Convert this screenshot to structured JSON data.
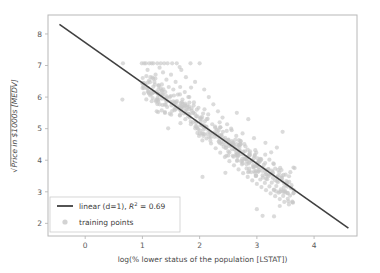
{
  "figure": {
    "background_color": "#ffffff",
    "axes_frame_color": "#b8b8b8",
    "plot_background": "#ffffff"
  },
  "chart_data": {
    "type": "scatter",
    "title": "",
    "xlabel": "log(% lower status of the population [LSTAT])",
    "ylabel": "Price in $1000s [MEDV]",
    "ylabel_prefix": "√",
    "xlim": [
      -0.65,
      4.75
    ],
    "ylim": [
      1.6,
      8.6
    ],
    "xticks": [
      0,
      1,
      2,
      3,
      4
    ],
    "xtick_labels": [
      "0",
      "1",
      "2",
      "3",
      "4"
    ],
    "yticks": [
      2,
      3,
      4,
      5,
      6,
      7,
      8
    ],
    "ytick_labels": [
      "2",
      "3",
      "4",
      "5",
      "6",
      "7",
      "8"
    ],
    "grid": false,
    "legend_position": "lower left",
    "series": [
      {
        "name": "training points",
        "type": "scatter",
        "marker_color": "#c8c8c8",
        "marker_size": 4.2,
        "marker_alpha": 0.65,
        "n_points": 506,
        "points": [
          [
            0.66,
            7.07
          ],
          [
            0.65,
            5.92
          ],
          [
            0.99,
            7.07
          ],
          [
            1.03,
            7.07
          ],
          [
            1.06,
            7.07
          ],
          [
            1.09,
            6.86
          ],
          [
            1.12,
            7.07
          ],
          [
            1.14,
            6.63
          ],
          [
            1.16,
            7.07
          ],
          [
            1.19,
            7.07
          ],
          [
            1.21,
            6.48
          ],
          [
            1.23,
            6.71
          ],
          [
            1.26,
            7.07
          ],
          [
            1.28,
            6.24
          ],
          [
            1.3,
            6.93
          ],
          [
            1.32,
            7.07
          ],
          [
            1.34,
            6.4
          ],
          [
            1.36,
            6.78
          ],
          [
            1.38,
            7.07
          ],
          [
            1.4,
            6.16
          ],
          [
            1.42,
            6.55
          ],
          [
            1.44,
            7.07
          ],
          [
            1.46,
            6.32
          ],
          [
            1.48,
            6.0
          ],
          [
            1.5,
            6.71
          ],
          [
            1.52,
            7.07
          ],
          [
            1.54,
            6.24
          ],
          [
            1.56,
            5.83
          ],
          [
            1.58,
            6.48
          ],
          [
            1.6,
            7.07
          ],
          [
            1.62,
            6.08
          ],
          [
            1.64,
            5.66
          ],
          [
            1.66,
            6.32
          ],
          [
            1.68,
            6.86
          ],
          [
            1.7,
            5.92
          ],
          [
            1.72,
            5.48
          ],
          [
            1.74,
            6.16
          ],
          [
            1.76,
            6.63
          ],
          [
            1.78,
            5.74
          ],
          [
            1.8,
            5.39
          ],
          [
            1.82,
            6.0
          ],
          [
            1.84,
            7.07
          ],
          [
            1.86,
            5.57
          ],
          [
            1.88,
            5.2
          ],
          [
            1.9,
            5.83
          ],
          [
            1.92,
            6.48
          ],
          [
            1.94,
            5.39
          ],
          [
            1.96,
            5.02
          ],
          [
            1.98,
            5.66
          ],
          [
            2.0,
            7.07
          ],
          [
            2.02,
            5.22
          ],
          [
            2.04,
            4.85
          ],
          [
            2.06,
            5.48
          ],
          [
            2.08,
            6.24
          ],
          [
            2.1,
            5.05
          ],
          [
            2.12,
            4.69
          ],
          [
            2.14,
            5.31
          ],
          [
            2.16,
            6.0
          ],
          [
            2.18,
            4.9
          ],
          [
            2.2,
            4.53
          ],
          [
            2.22,
            5.14
          ],
          [
            2.24,
            5.77
          ],
          [
            2.26,
            4.74
          ],
          [
            2.28,
            4.38
          ],
          [
            2.3,
            4.97
          ],
          [
            2.32,
            5.55
          ],
          [
            2.34,
            4.58
          ],
          [
            2.36,
            4.24
          ],
          [
            2.38,
            4.8
          ],
          [
            2.4,
            5.35
          ],
          [
            2.42,
            4.43
          ],
          [
            2.44,
            4.1
          ],
          [
            2.46,
            4.64
          ],
          [
            2.48,
            5.14
          ],
          [
            2.5,
            4.28
          ],
          [
            2.52,
            3.97
          ],
          [
            2.54,
            4.48
          ],
          [
            2.56,
            4.95
          ],
          [
            2.58,
            4.14
          ],
          [
            2.6,
            3.84
          ],
          [
            2.62,
            4.33
          ],
          [
            2.64,
            4.77
          ],
          [
            2.66,
            4.0
          ],
          [
            2.68,
            3.71
          ],
          [
            2.7,
            4.18
          ],
          [
            2.72,
            4.6
          ],
          [
            2.74,
            3.87
          ],
          [
            2.76,
            3.59
          ],
          [
            2.78,
            4.04
          ],
          [
            2.8,
            4.44
          ],
          [
            2.82,
            3.74
          ],
          [
            2.84,
            3.47
          ],
          [
            2.86,
            3.9
          ],
          [
            2.88,
            4.28
          ],
          [
            2.9,
            3.62
          ],
          [
            2.92,
            3.36
          ],
          [
            2.94,
            3.77
          ],
          [
            2.96,
            4.13
          ],
          [
            2.98,
            3.5
          ],
          [
            3.0,
            3.25
          ],
          [
            3.02,
            3.64
          ],
          [
            3.04,
            3.99
          ],
          [
            3.06,
            3.39
          ],
          [
            3.08,
            3.15
          ],
          [
            3.1,
            3.52
          ],
          [
            3.12,
            3.85
          ],
          [
            3.14,
            3.28
          ],
          [
            3.16,
            3.05
          ],
          [
            3.18,
            3.4
          ],
          [
            3.2,
            3.72
          ],
          [
            3.22,
            3.17
          ],
          [
            3.24,
            2.95
          ],
          [
            3.26,
            3.29
          ],
          [
            3.28,
            3.59
          ],
          [
            3.3,
            3.07
          ],
          [
            3.32,
            2.86
          ],
          [
            3.34,
            3.18
          ],
          [
            3.36,
            3.47
          ],
          [
            3.38,
            2.97
          ],
          [
            3.4,
            2.77
          ],
          [
            3.42,
            3.08
          ],
          [
            3.44,
            3.35
          ],
          [
            3.46,
            2.87
          ],
          [
            3.48,
            2.68
          ],
          [
            3.5,
            2.98
          ],
          [
            3.52,
            3.24
          ],
          [
            3.54,
            2.78
          ],
          [
            3.56,
            2.6
          ],
          [
            3.58,
            2.88
          ],
          [
            3.6,
            3.13
          ],
          [
            3.62,
            2.69
          ],
          [
            3.64,
            3.77
          ],
          [
            3.66,
            3.75
          ],
          [
            3.1,
            2.24
          ],
          [
            3.3,
            2.22
          ],
          [
            3.0,
            2.45
          ],
          [
            3.4,
            2.55
          ],
          [
            3.55,
            2.7
          ],
          [
            2.05,
            3.47
          ],
          [
            2.45,
            3.6
          ],
          [
            1.45,
            5.01
          ],
          [
            1.35,
            5.75
          ],
          [
            1.55,
            6.05
          ],
          [
            1.75,
            5.3
          ],
          [
            1.95,
            5.6
          ],
          [
            2.15,
            5.45
          ],
          [
            2.35,
            5.2
          ],
          [
            2.55,
            5.0
          ],
          [
            2.75,
            4.85
          ],
          [
            2.95,
            4.7
          ],
          [
            3.15,
            4.55
          ],
          [
            3.35,
            4.4
          ],
          [
            3.45,
            4.9
          ],
          [
            3.25,
            4.25
          ],
          [
            2.85,
            5.3
          ],
          [
            2.65,
            5.5
          ],
          [
            1.85,
            6.3
          ],
          [
            1.65,
            6.95
          ],
          [
            1.15,
            6.1
          ],
          [
            1.25,
            5.55
          ],
          [
            1.05,
            6.4
          ],
          [
            3.05,
            3.95
          ]
        ]
      },
      {
        "name": "linear (d=1)",
        "type": "line",
        "line_color": "#404040",
        "line_width": 1.6,
        "slope": -1.278,
        "intercept": 7.725,
        "x_start": -0.45,
        "x_end": 4.6,
        "y_start": 8.3,
        "y_end": 1.85,
        "r_squared": 0.69
      }
    ],
    "legend_entries": [
      {
        "handle": "line",
        "label_main": "linear (d=1), ",
        "label_italic": "R",
        "label_sup": "2",
        "label_tail": " = 0.69",
        "color": "#404040"
      },
      {
        "handle": "marker",
        "label_main": "training points",
        "color": "#c8c8c8"
      }
    ]
  }
}
